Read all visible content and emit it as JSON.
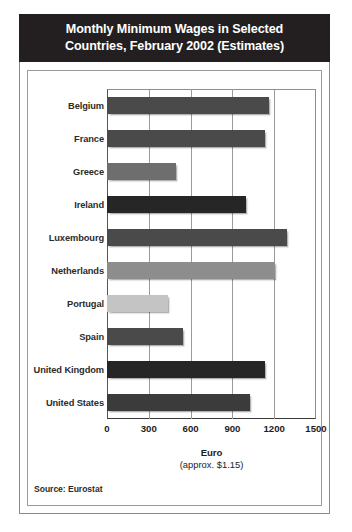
{
  "chart_data": {
    "type": "bar",
    "orientation": "horizontal",
    "title": "Monthly Minimum Wages in Selected Countries, February 2002 (Estimates)",
    "title_lines": [
      "Monthly Minimum Wages in Selected",
      "Countries, February 2002 (Estimates)"
    ],
    "xlabel": "Euro",
    "xlabel_sub": "(approx. $1.15)",
    "ylabel": "",
    "xlim": [
      0,
      1500
    ],
    "xticks": [
      0,
      300,
      600,
      900,
      1200,
      1500
    ],
    "xtick_labels": [
      "0",
      "300",
      "600",
      "900",
      "1200",
      "1500"
    ],
    "grid": true,
    "legend": "none",
    "source": "Source: Eurostat",
    "categories": [
      "Belgium",
      "France",
      "Greece",
      "Ireland",
      "Luxembourg",
      "Netherlands",
      "Portugal",
      "Spain",
      "United Kingdom",
      "United States"
    ],
    "values": [
      1163,
      1135,
      492,
      1000,
      1290,
      1207,
      438,
      546,
      1136,
      1025
    ],
    "bar_colors": [
      "#4a4a4a",
      "#4a4a4a",
      "#6e6e6e",
      "#262626",
      "#4a4a4a",
      "#8d8d8d",
      "#c4c4c4",
      "#4a4a4a",
      "#262626",
      "#3b3b3b"
    ],
    "series": [
      {
        "name": "Monthly minimum wage (Euro)",
        "values": [
          1163,
          1135,
          492,
          1000,
          1290,
          1207,
          438,
          546,
          1136,
          1025
        ]
      }
    ]
  },
  "colors": {
    "banner_background": "#231f20",
    "banner_text": "#ffffff",
    "card_border": "#8b8b8b",
    "grid": "#9b9b9b",
    "axis": "#3a3a3a",
    "page_background": "#ffffff"
  }
}
